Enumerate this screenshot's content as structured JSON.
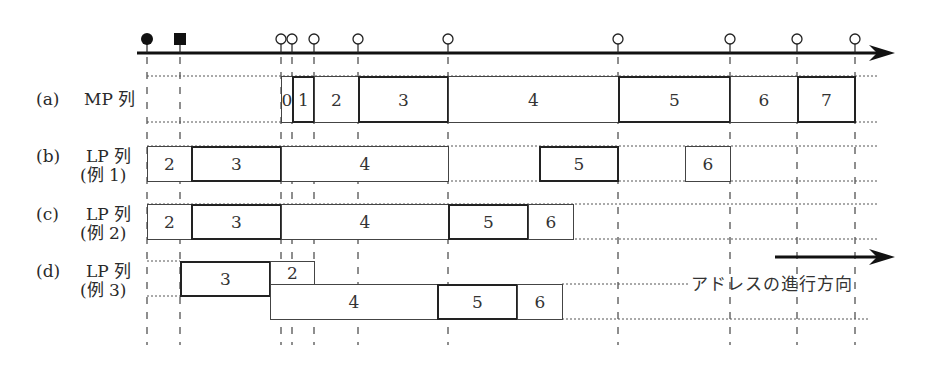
{
  "axis": {
    "start_markers": [
      {
        "x": 147,
        "shape": "filled-circle"
      },
      {
        "x": 180,
        "shape": "filled-square"
      }
    ],
    "open_circle_markers_x": [
      281,
      292,
      314,
      358,
      448,
      618,
      730,
      797,
      855
    ],
    "y": 53,
    "x_start": 137,
    "x_end": 895
  },
  "rows": [
    {
      "id": "a",
      "tag": "(a)",
      "label1": "MP 列",
      "label2": "",
      "y": 76,
      "h": 46,
      "blocks": [
        {
          "text": "0",
          "x0": 281,
          "x1": 292,
          "bold": false
        },
        {
          "text": "1",
          "x0": 292,
          "x1": 314,
          "bold": true
        },
        {
          "text": "2",
          "x0": 314,
          "x1": 358,
          "bold": false
        },
        {
          "text": "3",
          "x0": 358,
          "x1": 448,
          "bold": true
        },
        {
          "text": "4",
          "x0": 448,
          "x1": 618,
          "bold": false
        },
        {
          "text": "5",
          "x0": 618,
          "x1": 730,
          "bold": true
        },
        {
          "text": "6",
          "x0": 730,
          "x1": 797,
          "bold": false
        },
        {
          "text": "7",
          "x0": 797,
          "x1": 855,
          "bold": true
        }
      ]
    },
    {
      "id": "b",
      "tag": "(b)",
      "label1": "LP 列",
      "label2": "(例 1)",
      "y": 146,
      "h": 35,
      "blocks": [
        {
          "text": "2",
          "x0": 147,
          "x1": 191,
          "bold": false
        },
        {
          "text": "3",
          "x0": 191,
          "x1": 281,
          "bold": true
        },
        {
          "text": "4",
          "x0": 281,
          "x1": 448,
          "bold": false
        },
        {
          "text": "5",
          "x0": 539,
          "x1": 618,
          "bold": true
        },
        {
          "text": "6",
          "x0": 685,
          "x1": 730,
          "bold": false
        }
      ]
    },
    {
      "id": "c",
      "tag": "(c)",
      "label1": "LP 列",
      "label2": "(例 2)",
      "y": 204,
      "h": 35,
      "blocks": [
        {
          "text": "2",
          "x0": 147,
          "x1": 191,
          "bold": false
        },
        {
          "text": "3",
          "x0": 191,
          "x1": 281,
          "bold": true
        },
        {
          "text": "4",
          "x0": 281,
          "x1": 448,
          "bold": false
        },
        {
          "text": "5",
          "x0": 448,
          "x1": 528,
          "bold": true
        },
        {
          "text": "6",
          "x0": 528,
          "x1": 573,
          "bold": false
        }
      ]
    },
    {
      "id": "d",
      "tag": "(d)",
      "label1": "LP 列",
      "label2": "(例 3)",
      "y": 261,
      "h": 35,
      "blocks": [
        {
          "text": "3",
          "x0": 180,
          "x1": 270,
          "y0": 261,
          "y1": 296,
          "bold": true
        },
        {
          "text": "2",
          "x0": 270,
          "x1": 314,
          "y0": 261,
          "y1": 284,
          "bold": false
        },
        {
          "text": "4",
          "x0": 270,
          "x1": 437,
          "y0": 284,
          "y1": 319,
          "bold": false
        },
        {
          "text": "5",
          "x0": 437,
          "x1": 517,
          "y0": 284,
          "y1": 319,
          "bold": true
        },
        {
          "text": "6",
          "x0": 517,
          "x1": 562,
          "y0": 284,
          "y1": 319,
          "bold": false
        }
      ]
    }
  ],
  "legend": {
    "text": "アドレスの進行方向",
    "arrow_x0": 775,
    "arrow_x1": 895,
    "arrow_y": 257
  }
}
